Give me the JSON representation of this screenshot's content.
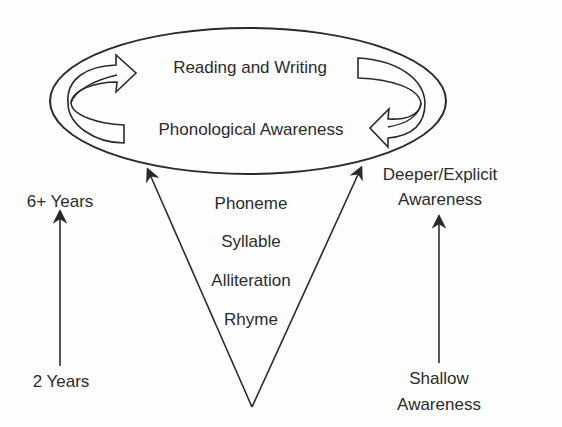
{
  "diagram": {
    "ellipse": {
      "top_label": "Reading and Writing",
      "bottom_label": "Phonological Awareness"
    },
    "triangle": {
      "levels": [
        "Phoneme",
        "Syllable",
        "Alliteration",
        "Rhyme"
      ]
    },
    "age_axis": {
      "top_label": "6+ Years",
      "bottom_label": "2 Years"
    },
    "awareness_axis": {
      "top_label_line1": "Deeper/Explicit",
      "top_label_line2": "Awareness",
      "bottom_label_line1": "Shallow",
      "bottom_label_line2": "Awareness"
    },
    "colors": {
      "line": "#2a2a2a",
      "text": "#2b2b2b",
      "background": "#fefefe"
    }
  }
}
